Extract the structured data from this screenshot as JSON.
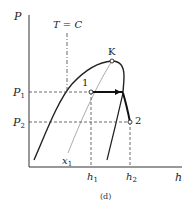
{
  "figure": {
    "caption": "(d)",
    "axes": {
      "y_label": "P",
      "x_label": "h"
    },
    "isotherm_label": "T = C",
    "critical_point_label": "K",
    "pressures": [
      {
        "symbol": "P",
        "sub": "1"
      },
      {
        "symbol": "P",
        "sub": "2"
      }
    ],
    "enthalpies": [
      {
        "symbol": "h",
        "sub": "1"
      },
      {
        "symbol": "h",
        "sub": "2"
      }
    ],
    "quality_line": {
      "symbol": "x",
      "sub": "1"
    },
    "states": [
      {
        "label": "1"
      },
      {
        "label": "2"
      }
    ],
    "colors": {
      "ink": "#222222",
      "thin": "#777777",
      "background": "#ffffff"
    }
  }
}
